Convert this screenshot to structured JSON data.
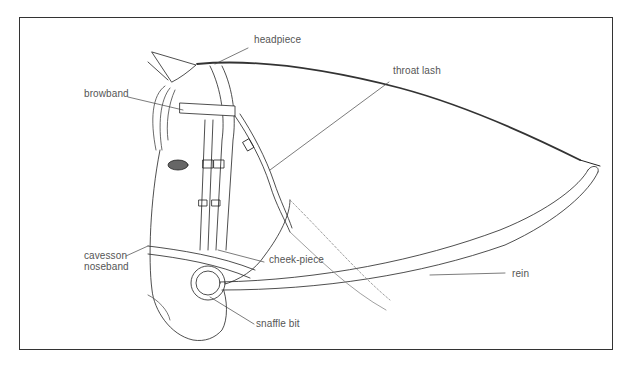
{
  "diagram": {
    "labels": [
      {
        "id": "headpiece",
        "text": "headpiece"
      },
      {
        "id": "browband",
        "text": "browband"
      },
      {
        "id": "throat-lash",
        "text": "throat lash"
      },
      {
        "id": "cavesson-noseband",
        "text": "cavesson\nnoseband",
        "line1": "cavesson",
        "line2": "noseband"
      },
      {
        "id": "cheek-piece",
        "text": "cheek-piece"
      },
      {
        "id": "rein",
        "text": "rein"
      },
      {
        "id": "snaffle-bit",
        "text": "snaffle bit"
      }
    ]
  },
  "colors": {
    "frame": "#333333",
    "line": "#222222",
    "label": "#555555",
    "background": "#ffffff"
  }
}
